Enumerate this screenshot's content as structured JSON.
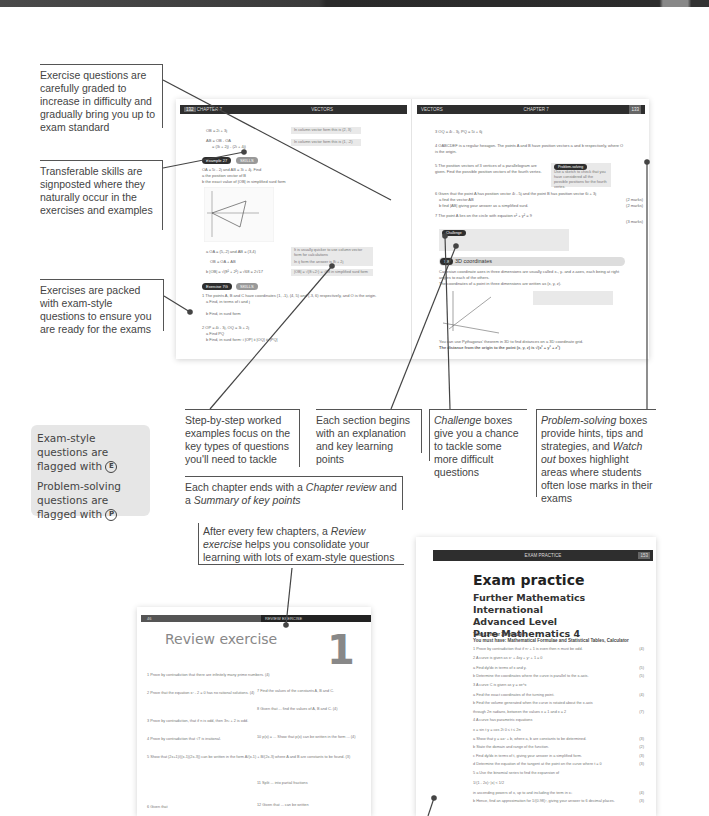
{
  "callouts": {
    "graded": "Exercise questions are carefully graded to increase in difficulty and gradually bring you up to exam standard",
    "transferable": "Transferable skills are signposted where they naturally occur in the exercises and examples",
    "packed": "Exercises are packed with exam-style questions to ensure you are ready for the exams",
    "worked": "Step-by-step worked examples focus on the key types of questions you'll need to tackle",
    "section": "Each section begins with an explanation and key learning points",
    "challenge_em": "Challenge",
    "challenge_rest": " boxes give you a chance to tackle some more difficult questions",
    "problem_em": "Problem-solving",
    "problem_mid": " boxes provide hints, tips and strategies, and ",
    "watch_em": "Watch out",
    "problem_rest": " boxes highlight areas where students often lose marks in their exams",
    "chapter_pre": "Each chapter ends with a ",
    "chapter_em1": "Chapter review",
    "chapter_mid": " and a ",
    "chapter_em2": "Summary of key points",
    "review_pre": "After every few chapters, a ",
    "review_em": "Review exercise",
    "review_rest": " helps you consolidate your learning with lots of exam-style questions"
  },
  "keybox": {
    "exam_text": "Exam-style questions are flagged with",
    "exam_flag": "E",
    "problem_text": "Problem-solving questions are flagged with",
    "problem_flag": "P"
  },
  "spread": {
    "left": {
      "page_num": "132",
      "chapter": "CHAPTER 7",
      "title": "VECTORS",
      "example_label": "Example",
      "example_num": "27",
      "skills_label": "SKILLS",
      "exercise_label": "Exercise",
      "exercise_num": "7G",
      "lines": [
        "OB = 2i + 3j",
        "AB = OB - OA",
        "= (3i + 2j) - (2i + 4j)",
        "OA = 5i - 2j and AB = 3i + 4j. Find",
        "a the position vector of B",
        "b the exact value of |OB| in simplified surd form",
        "1 The points A, B and C have coordinates (1, -1), (4, 5) and (-3, 6) respectively, and O is the origin.",
        "a Find, in terms of i and j",
        "b Find, in surd form",
        "2 OP = 4i - 3j, OQ = 3i + 2j",
        "a Find PQ",
        "b Find, in surd form: i |OP|  ii |OQ|  iii |PQ|"
      ],
      "notes": [
        "In column vector form this is (2, 3)",
        "In column vector form this is (1, -2)",
        "It is usually quicker to use column vector form for calculations",
        "In ij form the answer is 8i + 2j",
        "|OB| = √(8²+2²) = √68 in simplified surd form"
      ]
    },
    "right": {
      "page_num": "133",
      "chapter": "CHAPTER 7",
      "title": "VECTORS",
      "problem_label": "Problem-solving",
      "problem_text": "Use a sketch to check that you have considered all the possible positions for the fourth vertex.",
      "challenge_label": "Challenge",
      "section_num": "7.8",
      "section_title": "3D coordinates",
      "lines": [
        "3 OQ = 4i - 3j, PQ = 5i + 6j",
        "4 OABCDEF is a regular hexagon. The points A and B have position vectors a and b respectively, where O is the origin.",
        "5 The position vectors of 3 vertices of a parallelogram are given. Find the possible position vectors of the fourth vertex.",
        "6 Given that the point A has position vector 4i - 5j and the point B has position vector 6i + 3j",
        "a find the vector AB",
        "b find |AB| giving your answer as a simplified surd.",
        "7 The point A lies on the circle with equation x² + y² = 9",
        "Cartesian coordinate axes in three dimensions are usually called x-, y- and z-axes, each being at right angles to each of the others.",
        "The coordinates of a point in three dimensions are written as (x, y, z).",
        "You can use Pythagoras' theorem in 3D to find distances on a 3D coordinate grid.",
        "The distance from the origin to the point (x, y, z) is √(x² + y² + z²)"
      ],
      "marks": [
        "(2 marks)",
        "(2 marks)",
        "(3 marks)"
      ]
    }
  },
  "review": {
    "header": "REVIEW EXERCISE",
    "page_num": "46",
    "title": "Review exercise",
    "number": "1",
    "questions": [
      "1 Prove by contradiction that there are infinitely many prime numbers. (4)",
      "2 Prove that the equation x² - 2 = 0 has no rational solutions. (4)",
      "3 Prove by contradiction, that if n is odd, then 3n³ + 2 is odd.",
      "4 Prove by contradiction that √7 is irrational.",
      "5 Show that (2x+1)/((x-1)(2x-3)) can be written in the form A/(x-1) + B/(2x-3) where A and B are constants to be found. (3)",
      "6 Given that",
      "7 Find the values of the constants A, B and C.",
      "8 Given that ... find the values of A, B and C. (4)",
      "10 p(x) = ... Show that p(x) can be written in the form ... (4)",
      "11 Split ... into partial fractions",
      "12 Given that ... can be written"
    ]
  },
  "exam": {
    "header": "EXAM PRACTICE",
    "page_num": "153",
    "title": "Exam practice",
    "subtitle_lines": [
      "Further Mathematics International",
      "Advanced Level",
      "Pure Mathematics 4"
    ],
    "time": "Time: 1 hour 30 minutes",
    "must_have": "You must have: Mathematical Formulae and Statistical Tables, Calculator",
    "questions": [
      {
        "text": "1   Prove by contradiction that if n² + 1 is even then n must be odd.",
        "marks": "(4)"
      },
      {
        "text": "2   A curve is given as x² + 4xy + y² + 1 = 0",
        "marks": ""
      },
      {
        "text": "     a  Find dy/dx in terms of x and y.",
        "marks": "(5)"
      },
      {
        "text": "     b  Determine the coordinates where the curve is parallel to the x-axis.",
        "marks": "(5)"
      },
      {
        "text": "3   A curve C is given as y = xe^x",
        "marks": ""
      },
      {
        "text": "     a  Find the exact coordinates of the turning point.",
        "marks": "(4)"
      },
      {
        "text": "     b  Find the volume generated when the curve is rotated about the x-axis",
        "marks": ""
      },
      {
        "text": "         through 2π radians, between the values x = 1 and x = 2",
        "marks": "(7)"
      },
      {
        "text": "4   A curve has parametric equations",
        "marks": ""
      },
      {
        "text": "         x = sin t        y = cos 2t        0 ≤ t ≤ 2π",
        "marks": ""
      },
      {
        "text": "     a  Show that y = ax² + b, where a, b are constants to be determined.",
        "marks": "(3)"
      },
      {
        "text": "     b  State the domain and range of the function.",
        "marks": "(2)"
      },
      {
        "text": "     c  Find dy/dx in terms of t, giving your answer in a simplified form.",
        "marks": "(3)"
      },
      {
        "text": "     d  Determine the equation of the tangent at the point on the curve where t = θ",
        "marks": "(3)"
      },
      {
        "text": "5   a  Use the binomial series to find the expansion of",
        "marks": ""
      },
      {
        "text": "         1/(1 - 2x)²        |x| < 1/2",
        "marks": ""
      },
      {
        "text": "         in ascending powers of x, up to and including the term in x³",
        "marks": "(4)"
      },
      {
        "text": "     b  Hence, find an approximation for 1/(0.98)², giving your answer to 6 decimal places.",
        "marks": "(3)"
      }
    ]
  }
}
